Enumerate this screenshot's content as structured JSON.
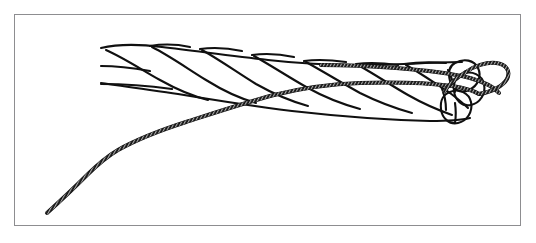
{
  "figure": {
    "title": "Three-strand rope with whipping cord threaded through the end",
    "style": "black ink line art on white",
    "background_color": "#ffffff",
    "line_color": "#101010",
    "frame_color": "#8d8d90"
  },
  "frame": {
    "x": 14,
    "y": 14,
    "width": 507,
    "height": 212,
    "border_width": 1
  },
  "elements": {
    "rope": {
      "name": "three-strand-rope",
      "strand_count": 3,
      "lay_direction": "right-handed",
      "left_end_x": 100,
      "right_end_x": 482,
      "top_y": 45,
      "bottom_y": 122,
      "cut_end_label": "rope-cut-end",
      "stroke_width": 2.1
    },
    "cord": {
      "name": "whipping-cord",
      "texture": "braided-hatched",
      "tail_end_x": 47,
      "tail_end_y": 213,
      "free_end_x": 321,
      "free_end_y": 65,
      "stroke_width": 3.4,
      "hatch_spacing": 3
    },
    "cord_loop": {
      "name": "cord-loop-around-end",
      "center_x": 468,
      "center_y": 82,
      "rx": 48,
      "ry": 21,
      "rotation_deg": -10
    }
  },
  "chart_data": {
    "type": "line",
    "title": "Three-strand rope with whipping cord threaded through the end",
    "xlabel": "",
    "ylabel": "",
    "xlim": [
      0,
      536
    ],
    "ylim": [
      243,
      0
    ],
    "grid": false,
    "legend": "none",
    "series": [
      {
        "name": "rope-outline-top",
        "comment": "upper silhouette of the laid rope",
        "x": [
          100,
          140,
          190,
          250,
          320,
          390,
          440,
          470,
          482
        ],
        "y": [
          48,
          45,
          47,
          52,
          58,
          62,
          63,
          62,
          66
        ]
      },
      {
        "name": "rope-outline-bottom",
        "comment": "lower silhouette of the laid rope",
        "x": [
          100,
          140,
          190,
          250,
          320,
          390,
          440,
          470,
          480
        ],
        "y": [
          82,
          88,
          94,
          102,
          110,
          117,
          121,
          120,
          115
        ]
      },
      {
        "name": "rope-strand-lines",
        "comment": "six diagonal strand boundaries running down-right across the rope body",
        "x": [
          100,
          160,
          220,
          280,
          340,
          400,
          450
        ],
        "y": [
          60,
          70,
          80,
          90,
          98,
          106,
          112
        ]
      },
      {
        "name": "cord-lower-run",
        "comment": "cord tail emerging below-left of the rope and rising to cross it",
        "x": [
          47,
          70,
          95,
          120,
          150,
          190,
          230,
          270,
          310,
          350,
          400,
          450,
          478
        ],
        "y": [
          213,
          196,
          178,
          165,
          152,
          136,
          120,
          104,
          92,
          86,
          83,
          83,
          88
        ]
      },
      {
        "name": "cord-upper-run",
        "comment": "cord free end lying over the top of the rope toward the tip",
        "x": [
          321,
          360,
          400,
          440,
          470,
          490,
          500
        ],
        "y": [
          65,
          66,
          68,
          70,
          73,
          80,
          88
        ]
      },
      {
        "name": "cord-loop",
        "comment": "closed loop of cord encircling the cut end of the rope",
        "x": [
          430,
          460,
          492,
          508,
          500,
          470,
          440,
          425,
          430
        ],
        "y": [
          70,
          64,
          66,
          79,
          93,
          99,
          96,
          82,
          70
        ]
      },
      {
        "name": "rope-end-ellipses",
        "comment": "three elliptical strand cross-sections at the cut end",
        "x": [
          466,
          476,
          470
        ],
        "y": [
          74,
          90,
          104
        ]
      }
    ]
  }
}
